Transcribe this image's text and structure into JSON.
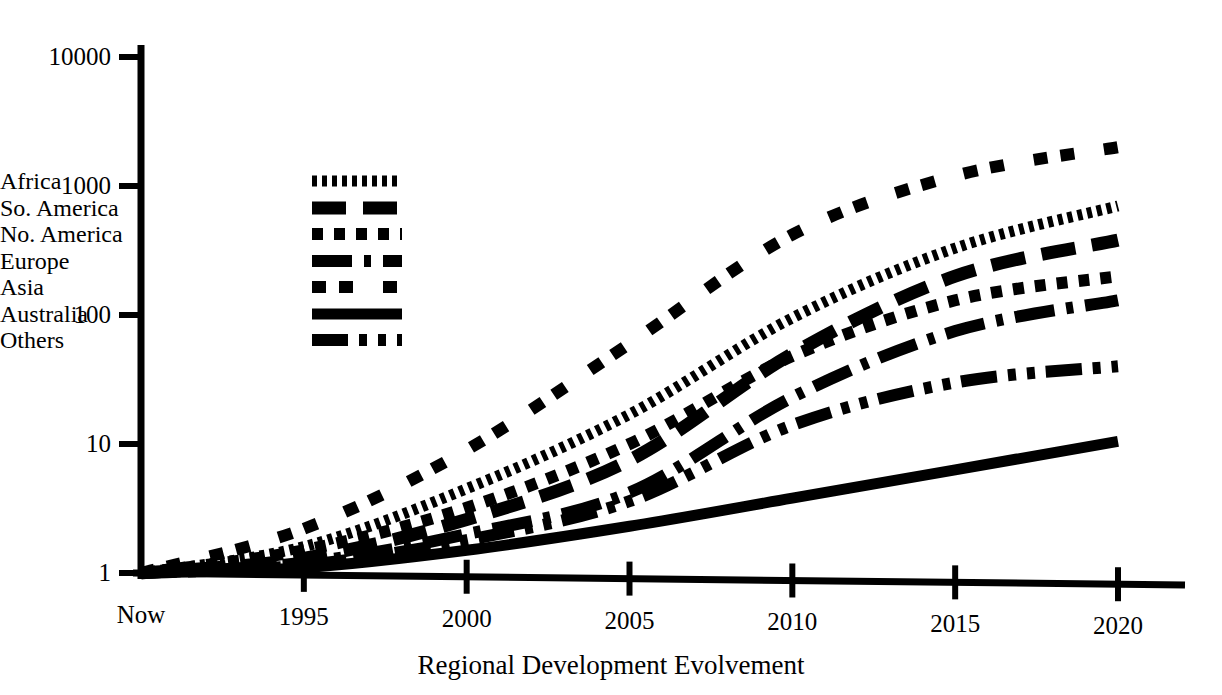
{
  "chart_data": {
    "type": "line",
    "title": "Regional Development Evolvement",
    "xlabel": "",
    "ylabel": "",
    "yscale": "log",
    "ylim": [
      1,
      10000
    ],
    "ytick_labels": [
      "1",
      "10",
      "100",
      "1000",
      "10000"
    ],
    "ytick_values": [
      1,
      10,
      100,
      1000,
      10000
    ],
    "x": [
      1990,
      1995,
      2000,
      2005,
      2010,
      2015,
      2020
    ],
    "xtick_labels": [
      "Now",
      "1995",
      "2000",
      "2005",
      "2010",
      "2015",
      "2020"
    ],
    "grid": false,
    "legend_position": "upper left",
    "series": [
      {
        "name": "Africa",
        "dash": "fine-dense",
        "values": [
          1,
          1.6,
          4.5,
          17,
          95,
          330,
          700
        ]
      },
      {
        "name": "So. America",
        "dash": "long-dash",
        "values": [
          1,
          1.3,
          2.6,
          7.5,
          50,
          200,
          380
        ]
      },
      {
        "name": "No. America",
        "dash": "square-dot",
        "values": [
          1,
          1.5,
          3.2,
          10,
          48,
          130,
          200
        ]
      },
      {
        "name": "Europe",
        "dash": "dash-dot-sm",
        "values": [
          1,
          1.2,
          2.0,
          4.2,
          23,
          75,
          130
        ]
      },
      {
        "name": "Asia",
        "dash": "double-dash",
        "values": [
          1,
          2.2,
          9.0,
          60,
          420,
          1200,
          2000
        ]
      },
      {
        "name": "Australia",
        "dash": "solid",
        "values": [
          1,
          1.1,
          1.5,
          2.3,
          3.8,
          6.3,
          10.5
        ]
      },
      {
        "name": "Others",
        "dash": "dash-dot",
        "values": [
          1,
          1.15,
          1.8,
          3.6,
          14,
          30,
          40
        ]
      }
    ]
  },
  "legend": {
    "items": [
      {
        "label": "Africa"
      },
      {
        "label": "So. America"
      },
      {
        "label": "No. America"
      },
      {
        "label": "Europe"
      },
      {
        "label": "Asia"
      },
      {
        "label": "Australia"
      },
      {
        "label": "Others"
      }
    ]
  },
  "axes": {
    "x_title": "Regional Development Evolvement"
  }
}
